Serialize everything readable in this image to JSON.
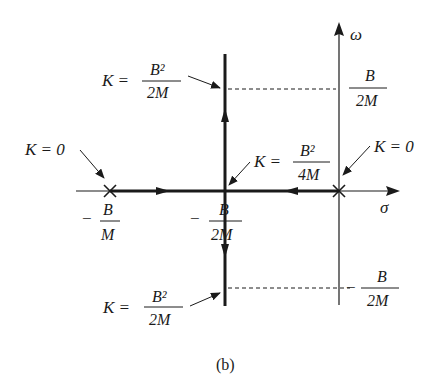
{
  "figure": {
    "caption": "(b)",
    "type": "root-locus",
    "axes": {
      "horizontal_label": "σ",
      "vertical_label": "ω"
    },
    "poles": [
      {
        "label_annotation": "K = 0",
        "position_label_sign": "−",
        "position_num": "B",
        "position_den": "M"
      },
      {
        "label_annotation": "K = 0",
        "position": "origin"
      }
    ],
    "breakaway": {
      "position_label_sign": "−",
      "position_num": "B",
      "position_den": "2M",
      "gain_label": "K =",
      "gain_num": "B²",
      "gain_den": "4M"
    },
    "upper_marker": {
      "gain_label": "K =",
      "gain_num": "B²",
      "gain_den": "2M",
      "omega_num": "B",
      "omega_den": "2M",
      "omega_sign": ""
    },
    "lower_marker": {
      "gain_label": "K =",
      "gain_num": "B²",
      "gain_den": "2M",
      "omega_num": "B",
      "omega_den": "2M",
      "omega_sign": "−"
    },
    "colors": {
      "ink": "#1a1a1a",
      "background": "#ffffff"
    }
  }
}
